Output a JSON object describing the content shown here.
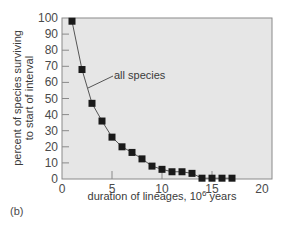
{
  "chart_data": {
    "type": "line",
    "title": "",
    "xlabel": "duration of lineages, 10^6 years",
    "xlabel_main": "duration of lineages, 10",
    "xlabel_sup": "6",
    "xlabel_tail": " years",
    "ylabel": "percent of species surviving to start of interval",
    "ylabel_line1": "percent of species surviving",
    "ylabel_line2": "to start of interval",
    "xlim": [
      0,
      20
    ],
    "ylim": [
      0,
      100
    ],
    "xticks": [
      0,
      5,
      10,
      15,
      20
    ],
    "yticks": [
      0,
      10,
      20,
      30,
      40,
      50,
      60,
      70,
      80,
      90,
      100
    ],
    "grid": false,
    "legend": "none",
    "annotations": [
      {
        "text": "all species",
        "x": 5.3,
        "y": 64
      }
    ],
    "series": [
      {
        "name": "all species",
        "marker": "square",
        "x": [
          1,
          2,
          3,
          4,
          5,
          6,
          7,
          8,
          9,
          10,
          11,
          12,
          13,
          14,
          15,
          16,
          17
        ],
        "values": [
          98,
          68,
          47,
          36,
          26,
          20,
          16.5,
          12.5,
          8,
          6,
          4.5,
          4.5,
          3.5,
          0.5,
          0.5,
          0.5,
          0.5
        ]
      }
    ]
  },
  "panel_label": "(b)",
  "colors": {
    "plot_bg": "#e6e6e6",
    "plot_border": "#8a8a8a",
    "marker": "#1a1a1a",
    "line": "#555555"
  }
}
